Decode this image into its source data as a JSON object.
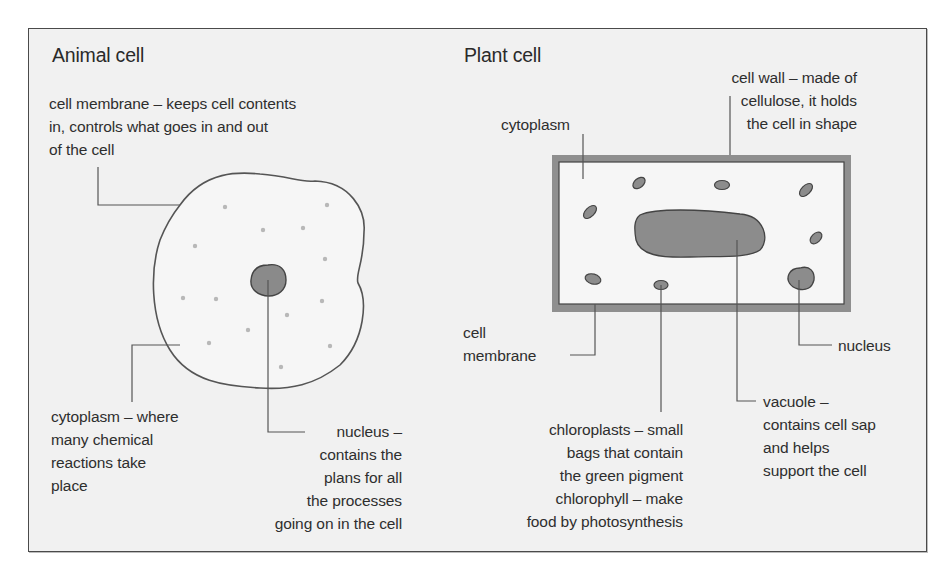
{
  "figure": {
    "type": "labelled biology diagram",
    "panels": [
      {
        "title": "Animal cell",
        "labels": {
          "cell_membrane": [
            "cell membrane – keeps cell contents",
            "in, controls what goes in and out",
            "of the cell"
          ],
          "cytoplasm": [
            "cytoplasm – where",
            "many chemical",
            "reactions take",
            "place"
          ],
          "nucleus": [
            "nucleus –",
            "contains the",
            "plans for all",
            "the processes",
            "going on in the cell"
          ]
        }
      },
      {
        "title": "Plant cell",
        "labels": {
          "cell_wall": [
            "cell wall – made of",
            "cellulose, it holds",
            "the cell in shape"
          ],
          "cytoplasm": [
            "cytoplasm"
          ],
          "cell_membrane": [
            "cell",
            "membrane"
          ],
          "nucleus": [
            "nucleus"
          ],
          "chloroplasts": [
            "chloroplasts – small",
            "bags that contain",
            "the green pigment",
            "chlorophyll – make",
            "food by photosynthesis"
          ],
          "vacuole": [
            "vacuole –",
            "contains cell sap",
            "and helps",
            "support the cell"
          ]
        }
      }
    ]
  },
  "colors": {
    "background": "#f1f1f1",
    "frame_border": "#4a4a4a",
    "cell_outline": "#555555",
    "organelle_fill": "#8c8c8c",
    "cell_wall": "#8f8f8f",
    "cytoplasm_fill": "#f5f5f5",
    "leader_line": "#555555",
    "granule": "#b5b5b5"
  }
}
